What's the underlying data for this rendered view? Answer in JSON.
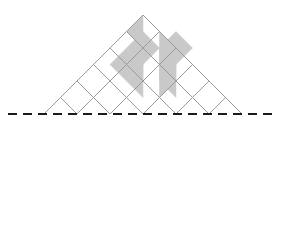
{
  "figure": {
    "type": "geometric-diagram",
    "canvas": {
      "width": 281,
      "height": 226,
      "background": "#ffffff"
    },
    "colors": {
      "grid_line": "#9a9a9a",
      "shade_fill": "#c9c9c9",
      "shade_stroke": "#b0b0b0",
      "dashed_line": "#1a1a1a",
      "background": "#ffffff"
    },
    "grid": {
      "shape": "diamond",
      "description": "Square grid rotated 45 degrees, 6 by 6 cells",
      "cells_per_side": 6,
      "center": {
        "x": 143,
        "y": 114
      },
      "half_diagonal": 99,
      "cell_step": 16.5,
      "stroke_width": 1,
      "vertices": {
        "top": {
          "x": 143,
          "y": 15
        },
        "right": {
          "x": 242,
          "y": 114
        },
        "bottom": {
          "x": 143,
          "y": 213
        },
        "left": {
          "x": 44,
          "y": 114
        }
      }
    },
    "dashed_line": {
      "label": "axis of symmetry",
      "orientation": "horizontal",
      "y": 114,
      "x_start": 8,
      "x_end": 273,
      "dash_pattern": "9 6",
      "stroke_width": 2
    },
    "shaded_cells": {
      "note": "Cell coordinates use grid column (i) and row (j) indices measured from the top vertex; 'full' shades the whole rhombus, 'left'/'right' shade a triangular half split by the cell's vertical diagonal.",
      "count": 11,
      "items": [
        {
          "i": 0,
          "j": 0,
          "part": "left"
        },
        {
          "i": 0,
          "j": 1,
          "part": "full"
        },
        {
          "i": -1,
          "j": 2,
          "part": "full"
        },
        {
          "i": 0,
          "j": 2,
          "part": "left"
        },
        {
          "i": 0,
          "j": 3,
          "part": "left"
        },
        {
          "i": 1,
          "j": 1,
          "part": "right"
        },
        {
          "i": 1,
          "j": 2,
          "part": "right"
        },
        {
          "i": 1,
          "j": 3,
          "part": "right"
        },
        {
          "i": 2,
          "j": 2,
          "part": "left"
        },
        {
          "i": 2,
          "j": 3,
          "part": "left"
        },
        {
          "i": 2,
          "j": 1,
          "part": "full"
        }
      ]
    }
  }
}
